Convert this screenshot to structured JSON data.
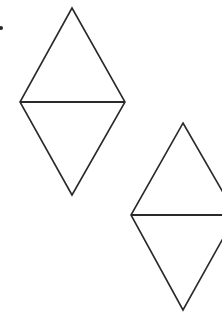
{
  "diagram": {
    "title": "",
    "background": "#ffffff",
    "stroke_color": "#2a2a2a",
    "stroke_width": 1.6,
    "marker": {
      "name": "dot-marker",
      "cx": 1,
      "cy": 28,
      "r": 2
    },
    "shapes": [
      {
        "name": "rhombus-1",
        "type": "rhombus-split-into-two-triangles",
        "vertices": {
          "top": [
            72,
            8
          ],
          "left": [
            20,
            102
          ],
          "right": [
            125,
            102
          ],
          "bottom": [
            72,
            195
          ]
        },
        "diagonal": "horizontal"
      },
      {
        "name": "rhombus-2",
        "type": "rhombus-split-into-two-triangles",
        "vertices": {
          "top": [
            183,
            123
          ],
          "left": [
            131,
            215
          ],
          "right": [
            236,
            215
          ],
          "bottom": [
            183,
            310
          ]
        },
        "diagonal": "horizontal",
        "note": "right vertex extends beyond the visible crop"
      }
    ]
  }
}
